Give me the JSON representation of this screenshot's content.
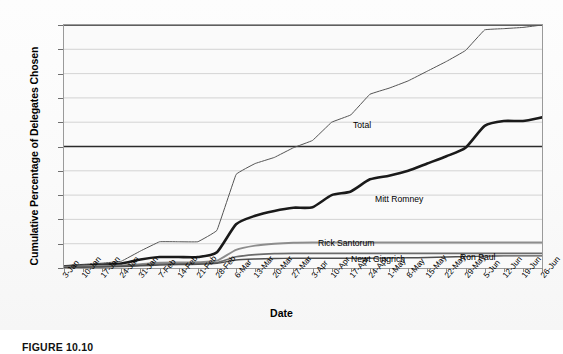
{
  "figure": {
    "caption": "FIGURE 10.10",
    "xlabel": "Date",
    "ylabel": "Cumulative Percentage of Delegates Chosen"
  },
  "annotations": {
    "total": "Total",
    "romney": "Mitt Romney",
    "santorum": "Rick Santorum",
    "gingrich": "Newt Gingrich",
    "paul": "Ron Paul"
  },
  "colors": {
    "total_line": "#555555",
    "romney_line": "#1a1a1a",
    "santorum_line": "#8d8d8d",
    "gingrich_line": "#6b6b6b",
    "paul_line": "#4f4f4f",
    "grid": "#c9c9c9",
    "frame": "#9a9a9a",
    "plot_bg": "#fafafa",
    "page_bg": "#ffffff"
  },
  "chart_data": {
    "type": "line",
    "title": "",
    "xlabel": "Date",
    "ylabel": "Cumulative Percentage of Delegates Chosen",
    "ylim": [
      0,
      100
    ],
    "ytick_step": 10,
    "yticks": [
      0,
      10,
      20,
      30,
      40,
      50,
      60,
      70,
      80,
      90,
      100
    ],
    "grid": true,
    "legend_position": "inline-labels",
    "x": [
      "3-Jan",
      "10-Jan",
      "17-Jan",
      "24-Jan",
      "31-Jan",
      "7-Feb",
      "14-Feb",
      "21-Feb",
      "28-Feb",
      "6-Mar",
      "13-Mar",
      "20-Mar",
      "27-Mar",
      "3-Apr",
      "10-Apr",
      "17-Apr",
      "24-Apr",
      "1-May",
      "8-May",
      "15-May",
      "22-May",
      "29-May",
      "5-Jun",
      "12-Jun",
      "19-Jun",
      "26-Jun"
    ],
    "series": [
      {
        "name": "Total",
        "values": [
          1.0,
          1.5,
          2.0,
          2.8,
          7.0,
          10.8,
          10.8,
          10.8,
          15.5,
          38.5,
          43.0,
          45.5,
          49.5,
          52.5,
          60.0,
          63.0,
          71.5,
          74.0,
          77.0,
          81.0,
          85.0,
          89.5,
          98.0,
          98.5,
          99.0,
          100.0
        ]
      },
      {
        "name": "Mitt Romney",
        "values": [
          0.6,
          0.9,
          1.3,
          1.8,
          3.5,
          4.5,
          4.5,
          4.5,
          6.5,
          18.0,
          21.5,
          23.5,
          24.8,
          25.0,
          30.0,
          31.5,
          36.5,
          38.0,
          40.0,
          43.0,
          46.0,
          49.5,
          58.5,
          60.5,
          60.5,
          62.0
        ]
      },
      {
        "name": "Rick Santorum",
        "values": [
          0.5,
          0.7,
          0.9,
          1.1,
          1.6,
          2.2,
          2.3,
          2.4,
          3.0,
          7.5,
          9.2,
          10.0,
          10.4,
          10.5,
          10.5,
          10.5,
          10.5,
          10.5,
          10.5,
          10.5,
          10.5,
          10.5,
          10.5,
          10.5,
          10.5,
          10.5
        ]
      },
      {
        "name": "Newt Gingrich",
        "values": [
          0.3,
          0.4,
          0.6,
          0.8,
          1.2,
          1.6,
          1.7,
          1.8,
          2.2,
          4.6,
          5.5,
          5.9,
          6.0,
          6.0,
          6.0,
          6.0,
          6.0,
          6.0,
          6.0,
          6.0,
          6.0,
          6.0,
          6.0,
          6.0,
          6.0,
          6.0
        ]
      },
      {
        "name": "Ron Paul",
        "values": [
          0.2,
          0.3,
          0.4,
          0.6,
          0.9,
          1.2,
          1.4,
          1.5,
          1.9,
          3.3,
          3.7,
          3.9,
          4.0,
          4.0,
          4.0,
          4.0,
          4.0,
          4.1,
          4.2,
          4.3,
          4.5,
          4.7,
          4.9,
          5.0,
          5.0,
          5.0
        ]
      }
    ]
  }
}
